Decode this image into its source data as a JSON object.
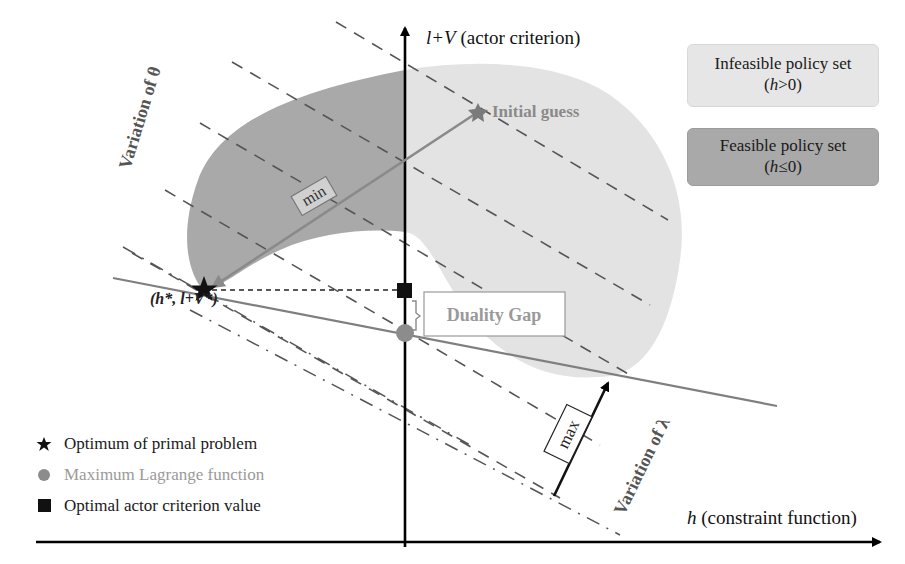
{
  "diagram": {
    "axes": {
      "y_label_italic": "l+V",
      "y_label_rest": " (actor criterion)",
      "x_label_italic": "h",
      "x_label_rest": " (constraint function)"
    },
    "region_legend": {
      "infeasible": {
        "line1": "Infeasible policy set",
        "line2_open": "(",
        "line2_var": "h",
        "line2_rest": ">0)",
        "color": "#e6e6e6"
      },
      "feasible": {
        "line1": "Feasible policy set",
        "line2_open": "(",
        "line2_var": "h",
        "line2_rest": "≤0)",
        "color": "#a9a9a9"
      }
    },
    "annotations": {
      "initial_guess": "Initial guess",
      "min_label": "min",
      "max_label": "max",
      "duality_gap": "Duality Gap",
      "optimum_point": "(h*, l+V*)",
      "variation_theta": "Variation of θ",
      "variation_lambda": "Variation of λ"
    },
    "markers": {
      "star_color": "#111111",
      "circle_color": "#8c8c8c",
      "square_color": "#111111",
      "initial_guess_color": "#7a7a7a"
    },
    "key": [
      {
        "symbol": "star",
        "label": "Optimum of primal problem",
        "color": "#1a1a1a"
      },
      {
        "symbol": "circle",
        "label": "Maximum Lagrange function",
        "color": "#9a9a9a"
      },
      {
        "symbol": "square",
        "label": "Optimal actor criterion value",
        "color": "#1a1a1a"
      }
    ]
  }
}
